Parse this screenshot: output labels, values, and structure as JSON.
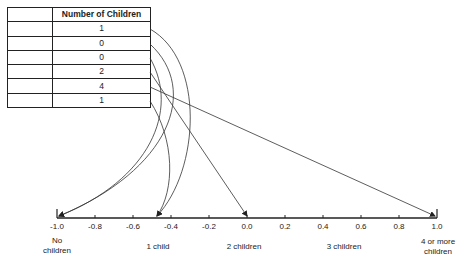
{
  "table": {
    "header": [
      "",
      "Number of Children"
    ],
    "rows": [
      {
        "label": "",
        "value": "1"
      },
      {
        "label": "",
        "value": "0"
      },
      {
        "label": "",
        "value": "0"
      },
      {
        "label": "",
        "value": "2"
      },
      {
        "label": "",
        "value": "4"
      },
      {
        "label": "",
        "value": "1"
      }
    ]
  },
  "axis": {
    "ticks": [
      "-1.0",
      "-0.8",
      "-0.6",
      "-0.4",
      "-0.2",
      "0.0",
      "0.2",
      "0.4",
      "0.6",
      "0.8",
      "1.0"
    ],
    "categories": [
      {
        "label_line1": "No",
        "label_line2": "children",
        "value": -1.0
      },
      {
        "label_line1": "1 child",
        "label_line2": "",
        "value": -0.5
      },
      {
        "label_line1": "2 children",
        "label_line2": "",
        "value": 0.0
      },
      {
        "label_line1": "3 children",
        "label_line2": "",
        "value": 0.5
      },
      {
        "label_line1": "4 or more",
        "label_line2": "children",
        "value": 1.0
      }
    ]
  },
  "mappings": [
    {
      "row": 1,
      "children": 1,
      "target": -0.5
    },
    {
      "row": 2,
      "children": 0,
      "target": -1.0
    },
    {
      "row": 3,
      "children": 0,
      "target": -1.0
    },
    {
      "row": 4,
      "children": 2,
      "target": 0.0
    },
    {
      "row": 5,
      "children": 4,
      "target": 1.0
    },
    {
      "row": 6,
      "children": 1,
      "target": -0.5
    }
  ],
  "colors": {
    "line": "#222222",
    "background": "#ffffff"
  }
}
